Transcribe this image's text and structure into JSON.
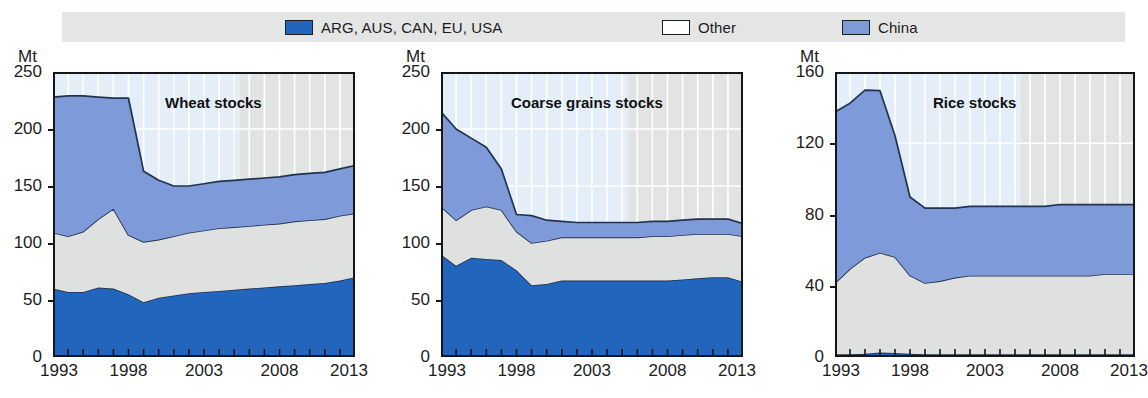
{
  "legend": {
    "items": [
      {
        "label": "ARG, AUS, CAN, EU, USA",
        "color": "#2166bc",
        "icon": "square-swatch-icon"
      },
      {
        "label": "Other",
        "color": "#e4e6e6",
        "icon": "square-swatch-icon"
      },
      {
        "label": "China",
        "color": "#7e9ad8",
        "icon": "square-swatch-icon"
      }
    ]
  },
  "chart_data": [
    {
      "type": "area",
      "title": "Wheat stocks",
      "xlabel": "",
      "ylabel": "Mt",
      "unit": "Mt",
      "stacked": true,
      "grid": true,
      "legend_position": "top",
      "x": [
        1993,
        1994,
        1995,
        1996,
        1997,
        1998,
        1999,
        2000,
        2001,
        2002,
        2003,
        2004,
        2005,
        2006,
        2007,
        2008,
        2009,
        2010,
        2011,
        2012,
        2013
      ],
      "xticks": [
        1993,
        1998,
        2003,
        2008,
        2013
      ],
      "ylim": [
        0,
        250
      ],
      "yticks": [
        0,
        50,
        100,
        150,
        200,
        250
      ],
      "series": [
        {
          "name": "ARG, AUS, CAN, EU, USA",
          "color": "#2166bc",
          "values": [
            60,
            57,
            57,
            61,
            60,
            55,
            48,
            52,
            54,
            56,
            57,
            58,
            59,
            60,
            61,
            62,
            63,
            64,
            65,
            67,
            70
          ]
        },
        {
          "name": "Other",
          "color": "#e4e6e6",
          "values": [
            49,
            49,
            53,
            60,
            70,
            52,
            53,
            51,
            52,
            53,
            54,
            55,
            55,
            55,
            55,
            55,
            56,
            56,
            56,
            57,
            56
          ]
        },
        {
          "name": "China",
          "color": "#7e9ad8",
          "values": [
            119,
            123,
            119,
            107,
            97,
            120,
            62,
            52,
            44,
            41,
            41,
            41,
            41,
            41,
            41,
            41,
            41,
            41,
            41,
            41,
            42
          ]
        }
      ],
      "totals": [
        228,
        229,
        229,
        228,
        227,
        227,
        163,
        155,
        150,
        150,
        152,
        154,
        155,
        156,
        157,
        158,
        160,
        161,
        162,
        165,
        168
      ]
    },
    {
      "type": "area",
      "title": "Coarse grains stocks",
      "xlabel": "",
      "ylabel": "Mt",
      "unit": "Mt",
      "stacked": true,
      "grid": true,
      "legend_position": "top",
      "x": [
        1993,
        1994,
        1995,
        1996,
        1997,
        1998,
        1999,
        2000,
        2001,
        2002,
        2003,
        2004,
        2005,
        2006,
        2007,
        2008,
        2009,
        2010,
        2011,
        2012,
        2013
      ],
      "xticks": [
        1993,
        1998,
        2003,
        2008,
        2013
      ],
      "ylim": [
        0,
        250
      ],
      "yticks": [
        0,
        50,
        100,
        150,
        200,
        250
      ],
      "series": [
        {
          "name": "ARG, AUS, CAN, EU, USA",
          "color": "#2166bc",
          "values": [
            90,
            80,
            87,
            86,
            85,
            76,
            63,
            64,
            67,
            67,
            67,
            67,
            67,
            67,
            67,
            67,
            68,
            69,
            70,
            70,
            66
          ]
        },
        {
          "name": "Other",
          "color": "#e4e6e6",
          "values": [
            42,
            40,
            42,
            46,
            44,
            34,
            37,
            38,
            38,
            38,
            38,
            38,
            38,
            38,
            39,
            39,
            39,
            39,
            38,
            38,
            40
          ]
        },
        {
          "name": "China",
          "color": "#7e9ad8",
          "values": [
            83,
            80,
            63,
            52,
            36,
            15,
            24,
            18,
            14,
            13,
            13,
            13,
            13,
            13,
            13,
            13,
            13,
            13,
            13,
            13,
            11
          ]
        }
      ],
      "totals": [
        215,
        200,
        192,
        184,
        165,
        125,
        124,
        120,
        119,
        118,
        118,
        118,
        118,
        118,
        119,
        119,
        120,
        121,
        121,
        121,
        117
      ]
    },
    {
      "type": "area",
      "title": "Rice stocks",
      "xlabel": "",
      "ylabel": "Mt",
      "unit": "Mt",
      "stacked": true,
      "grid": true,
      "legend_position": "top",
      "x": [
        1993,
        1994,
        1995,
        1996,
        1997,
        1998,
        1999,
        2000,
        2001,
        2002,
        2003,
        2004,
        2005,
        2006,
        2007,
        2008,
        2009,
        2010,
        2011,
        2012,
        2013
      ],
      "xticks": [
        1993,
        1998,
        2003,
        2008,
        2013
      ],
      "ylim": [
        0,
        160
      ],
      "yticks": [
        0,
        40,
        80,
        120,
        160
      ],
      "series": [
        {
          "name": "ARG, AUS, CAN, EU, USA",
          "color": "#2166bc",
          "values": [
            1.5,
            1.5,
            1.8,
            2.5,
            2.2,
            1.8,
            1.6,
            1.6,
            1.6,
            1.6,
            1.6,
            1.6,
            1.6,
            1.6,
            1.6,
            1.6,
            1.6,
            1.6,
            1.6,
            1.6,
            1.6
          ]
        },
        {
          "name": "Other",
          "color": "#e4e6e6",
          "values": [
            40,
            48,
            54,
            56,
            54,
            44,
            40,
            41,
            43,
            44,
            44,
            44,
            44,
            44,
            44,
            44,
            44,
            44,
            45,
            45,
            45
          ]
        },
        {
          "name": "China",
          "color": "#7e9ad8",
          "values": [
            96,
            93,
            94,
            91,
            68,
            44,
            42,
            41,
            39,
            39,
            39,
            39,
            39,
            39,
            39,
            40,
            40,
            40,
            39,
            39,
            39
          ]
        }
      ],
      "totals": [
        137,
        143,
        150,
        150,
        124,
        90,
        84,
        84,
        84,
        85,
        85,
        85,
        85,
        85,
        85,
        86,
        86,
        86,
        86,
        86,
        86
      ]
    }
  ]
}
